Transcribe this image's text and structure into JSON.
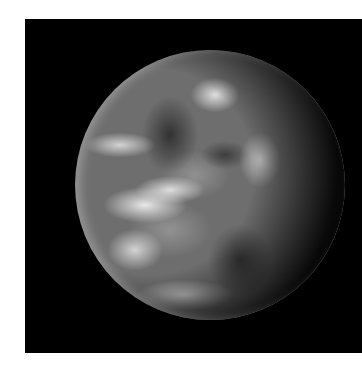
{
  "image": {
    "subject": "Earth viewed from space, black and white",
    "background_color": "#000000",
    "page_background": "#ffffff"
  }
}
